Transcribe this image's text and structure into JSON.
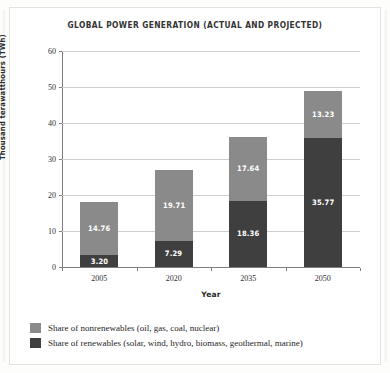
{
  "chart_data": {
    "type": "bar",
    "subtype": "stacked-vertical",
    "title": "GLOBAL POWER GENERATION (ACTUAL AND PROJECTED)",
    "xlabel": "Year",
    "ylabel": "Thousand terawatthours (TWh)",
    "categories": [
      "2005",
      "2020",
      "2035",
      "2050"
    ],
    "ylim": [
      0,
      60
    ],
    "yticks": [
      0,
      10,
      20,
      30,
      40,
      50,
      60
    ],
    "grid": "horizontal",
    "legend_position": "bottom-left",
    "series": [
      {
        "name": "Share of renewables (solar, wind, hydro, biomass, geothermal, marine)",
        "short_name": "renewables",
        "color": "#3f3f3f",
        "values": [
          3.2,
          7.29,
          18.36,
          35.77
        ],
        "labels": [
          "3.20",
          "7.29",
          "18.36",
          "35.77"
        ]
      },
      {
        "name": "Share of nonrenewables (oil, gas, coal, nuclear)",
        "short_name": "nonrenewables",
        "color": "#8a8a8a",
        "values": [
          14.76,
          19.71,
          17.64,
          13.23
        ],
        "labels": [
          "14.76",
          "19.71",
          "17.64",
          "13.23"
        ]
      }
    ],
    "totals": [
      17.96,
      27.0,
      36.0,
      49.0
    ]
  },
  "legend": {
    "items": [
      {
        "label": "Share of nonrenewables (oil, gas, coal, nuclear)",
        "color": "#8a8a8a"
      },
      {
        "label": "Share of renewables (solar, wind, hydro, biomass, geothermal, marine)",
        "color": "#3f3f3f"
      }
    ]
  },
  "colors": {
    "nonrenewables": "#8a8a8a",
    "renewables": "#3f3f3f",
    "gridline": "#cfcfcf",
    "axis": "#7d7d7d",
    "page": "#ffffff"
  }
}
